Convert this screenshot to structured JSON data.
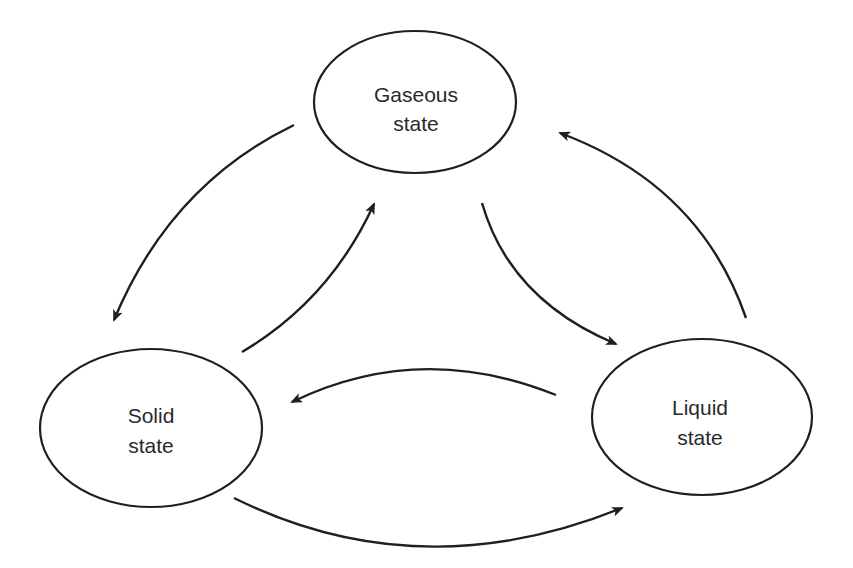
{
  "diagram": {
    "type": "state-cycle",
    "colors": {
      "stroke": "#1f1f1f",
      "text": "#2a2a2a",
      "background": "#ffffff"
    },
    "nodes": [
      {
        "id": "gaseous",
        "line1": "Gaseous",
        "line2": "state"
      },
      {
        "id": "solid",
        "line1": "Solid",
        "line2": "state"
      },
      {
        "id": "liquid",
        "line1": "Liquid",
        "line2": "state"
      }
    ],
    "edges": [
      {
        "from": "gaseous",
        "to": "solid"
      },
      {
        "from": "solid",
        "to": "gaseous"
      },
      {
        "from": "gaseous",
        "to": "liquid"
      },
      {
        "from": "liquid",
        "to": "gaseous"
      },
      {
        "from": "liquid",
        "to": "solid"
      },
      {
        "from": "solid",
        "to": "liquid"
      }
    ]
  }
}
